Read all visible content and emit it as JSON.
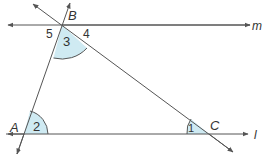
{
  "diagram": {
    "colors": {
      "line": "#555555",
      "angle_fill": "#cfeaf2",
      "text": "#333333"
    },
    "lines": {
      "m": {
        "label": "m"
      },
      "l": {
        "label": "l"
      }
    },
    "points": {
      "A": {
        "label": "A"
      },
      "B": {
        "label": "B"
      },
      "C": {
        "label": "C"
      }
    },
    "angles": {
      "a1": {
        "label": "1"
      },
      "a2": {
        "label": "2"
      },
      "a3": {
        "label": "3"
      },
      "a4": {
        "label": "4"
      },
      "a5": {
        "label": "5"
      }
    }
  }
}
